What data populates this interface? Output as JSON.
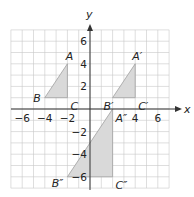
{
  "diagram": {
    "type": "coordinate-plane",
    "axes": {
      "x_label": "x",
      "y_label": "y",
      "x_range": [
        -7,
        7
      ],
      "y_range": [
        -7,
        7
      ]
    },
    "x_ticks": [
      {
        "value": -6,
        "label": "−6"
      },
      {
        "value": -4,
        "label": "−4"
      },
      {
        "value": -2,
        "label": "−2"
      },
      {
        "value": 4,
        "label": "4"
      },
      {
        "value": 6,
        "label": "6"
      }
    ],
    "y_ticks": [
      {
        "value": 6,
        "label": "6"
      },
      {
        "value": 4,
        "label": "4"
      },
      {
        "value": 2,
        "label": "2"
      },
      {
        "value": -2,
        "label": "−2"
      },
      {
        "value": -4,
        "label": "−4"
      },
      {
        "value": -6,
        "label": "−6"
      }
    ],
    "triangles": [
      {
        "name": "ABC",
        "vertices": [
          {
            "label": "A",
            "x": -2,
            "y": 4
          },
          {
            "label": "B",
            "x": -4,
            "y": 1
          },
          {
            "label": "C",
            "x": -2,
            "y": 1
          }
        ]
      },
      {
        "name": "A'B'C'",
        "vertices": [
          {
            "label": "A′",
            "x": 4,
            "y": 4
          },
          {
            "label": "B′",
            "x": 2,
            "y": 1
          },
          {
            "label": "C′",
            "x": 4,
            "y": 1
          }
        ]
      },
      {
        "name": "A''B''C''",
        "vertices": [
          {
            "label": "A″",
            "x": 2,
            "y": 0
          },
          {
            "label": "B″",
            "x": -2,
            "y": -6
          },
          {
            "label": "C″",
            "x": 2,
            "y": -6
          }
        ]
      }
    ],
    "colors": {
      "grid": "#c8c8c8",
      "axis": "#333333",
      "fill": "#d9d9d9",
      "stroke": "#a0a0a0"
    }
  }
}
